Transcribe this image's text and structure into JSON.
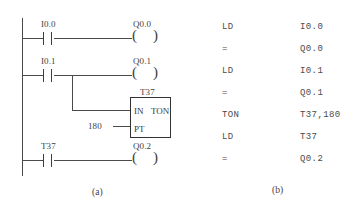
{
  "figure": {
    "captions": {
      "ladder": "(a)",
      "instruction_list": "(b)"
    }
  },
  "ladder": {
    "rungs": [
      {
        "contact": {
          "label": "I0.0",
          "type": "normally-open"
        },
        "coil": {
          "label": "Q0.0",
          "type": "output-coil"
        }
      },
      {
        "contact": {
          "label": "I0.1",
          "type": "normally-open"
        },
        "coil": {
          "label": "Q0.1",
          "type": "output-coil"
        }
      },
      {
        "contact": {
          "label": "T37",
          "type": "normally-open"
        },
        "coil": {
          "label": "Q0.2",
          "type": "output-coil"
        }
      }
    ],
    "timer_block": {
      "name": "T37",
      "in_pin": "IN",
      "type": "TON",
      "pt_pin": "PT",
      "pt_value": "180"
    }
  },
  "instruction_list": {
    "rows": [
      {
        "mnemonic": "LD",
        "operand": "I0.0"
      },
      {
        "mnemonic": "=",
        "operand": "Q0.0"
      },
      {
        "mnemonic": "LD",
        "operand": "I0.1"
      },
      {
        "mnemonic": "=",
        "operand": "Q0.1"
      },
      {
        "mnemonic": "TON",
        "operand": "T37,180"
      },
      {
        "mnemonic": "LD",
        "operand": "T37"
      },
      {
        "mnemonic": "=",
        "operand": "Q0.2"
      }
    ]
  },
  "colors": {
    "ink": "#3d3d3d",
    "background": "#ffffff"
  }
}
